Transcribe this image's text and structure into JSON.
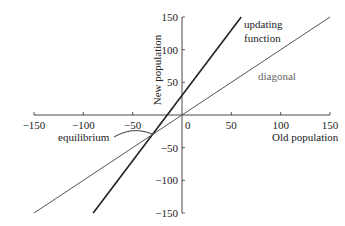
{
  "chart_data": {
    "type": "line",
    "title": "",
    "xlabel": "Old population",
    "ylabel": "New population",
    "xlim": [
      -150,
      150
    ],
    "ylim": [
      -150,
      150
    ],
    "xticks": [
      -150,
      -100,
      -50,
      0,
      50,
      100,
      150
    ],
    "yticks": [
      -150,
      -100,
      -50,
      50,
      100,
      150
    ],
    "xtick_labels": [
      "−150",
      "−100",
      "−50",
      "0",
      "50",
      "100",
      "150"
    ],
    "ytick_labels": [
      "−150",
      "−100",
      "−50",
      "50",
      "100",
      "150"
    ],
    "series": [
      {
        "name": "updating function",
        "label_line1": "updating",
        "label_line2": "function",
        "x": [
          -90,
          60
        ],
        "y": [
          -150,
          150
        ],
        "color": "#222222"
      },
      {
        "name": "diagonal",
        "x": [
          -150,
          150
        ],
        "y": [
          -150,
          150
        ],
        "color": "#555555"
      }
    ],
    "annotations": [
      {
        "text": "equilibrium",
        "x": -30,
        "y": -30
      }
    ]
  }
}
